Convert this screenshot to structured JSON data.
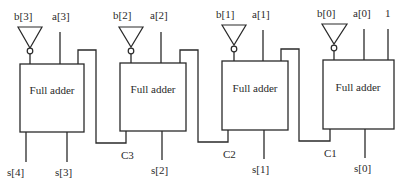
{
  "diagram": {
    "type": "4-bit subtractor (ripple-carry adder with inverted B inputs)",
    "stages": [
      {
        "label": "Full adder",
        "input_b": "b[3]",
        "input_a": "a[3]",
        "sum_out": "s[3]",
        "carry_out": "s[4]"
      },
      {
        "label": "Full adder",
        "input_b": "b[2]",
        "input_a": "a[2]",
        "sum_out": "s[2]",
        "carry_out": "C3"
      },
      {
        "label": "Full adder",
        "input_b": "b[1]",
        "input_a": "a[1]",
        "sum_out": "s[1]",
        "carry_out": "C2"
      },
      {
        "label": "Full adder",
        "input_b": "b[0]",
        "input_a": "a[0]",
        "carry_in": "1",
        "sum_out": "s[0]",
        "carry_out": "C1"
      }
    ],
    "colors": {
      "line": "#2a2a2a",
      "background": "#ffffff"
    }
  }
}
